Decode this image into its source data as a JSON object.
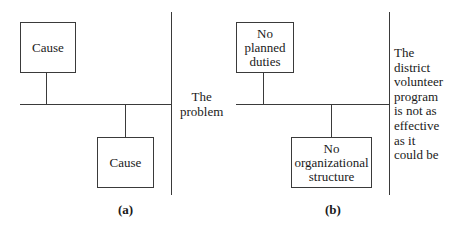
{
  "diagrams": [
    {
      "label": "(a)",
      "causes": [
        "Cause",
        "Cause"
      ],
      "effect": "The problem",
      "effect_lines": [
        "The",
        "problem"
      ]
    },
    {
      "label": "(b)",
      "causes": [
        "No planned duties",
        "No organizational structure"
      ],
      "cause_lines": [
        [
          "No",
          "planned",
          "duties"
        ],
        [
          "No",
          "organizational",
          "structure"
        ]
      ],
      "effect": "The district volunteer program is not as effective as it could be",
      "effect_lines": [
        "The",
        "district",
        "volunteer",
        "program",
        "is not as",
        "effective",
        "as it",
        "could be"
      ]
    }
  ],
  "colors": {
    "line": "#3a3a3a",
    "text": "#1a1a1a",
    "background": "#ffffff"
  }
}
